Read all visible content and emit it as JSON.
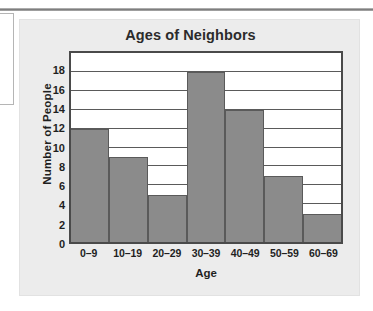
{
  "page": {
    "background_color": "#ffffff",
    "panel_color": "#ececec",
    "rule_color": "#6e6e6e"
  },
  "chart_data": {
    "type": "bar",
    "title": "Ages of Neighbors",
    "xlabel": "Age",
    "ylabel": "Number of People",
    "categories": [
      "0–9",
      "10–19",
      "20–29",
      "30–39",
      "40–49",
      "50–59",
      "60–69"
    ],
    "values": [
      12,
      9,
      5,
      18,
      14,
      7,
      3
    ],
    "ylim": [
      0,
      20
    ],
    "yticks": [
      0,
      2,
      4,
      6,
      8,
      10,
      12,
      14,
      16,
      18
    ],
    "ytick_labels": [
      "0",
      "2",
      "4",
      "6",
      "8",
      "10",
      "12",
      "14",
      "16",
      "18"
    ],
    "grid": true,
    "grid_axis": "y",
    "legend": null,
    "bar_color": "#8b8b8b",
    "bar_edge_color": "#5a5a5a",
    "axis_color": "#4a4a4a",
    "bar_gap": 0
  }
}
